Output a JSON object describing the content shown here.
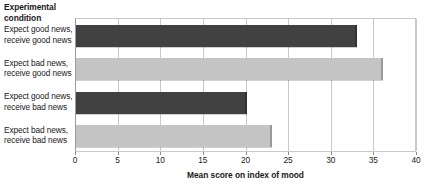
{
  "chart_data": {
    "type": "bar",
    "orientation": "horizontal",
    "title": "",
    "xlabel": "Mean score on index of mood",
    "ylabel": "Experimental\ncondition",
    "categories": [
      "Expect good news, receive good news",
      "Expect bad news, receive good news",
      "Expect good news, receive bad news",
      "Expect bad news, receive bad news"
    ],
    "values": [
      33,
      36,
      20,
      23
    ],
    "xlim": [
      0,
      40
    ],
    "xticks": [
      0,
      5,
      10,
      15,
      20,
      25,
      30,
      35,
      40
    ],
    "grid": true,
    "grid_axis": "x",
    "legend": false,
    "bar_colors": [
      "#414141",
      "#c4c4c4",
      "#414141",
      "#c4c4c4"
    ]
  },
  "axes": {
    "category_axis_title_lines": [
      "Experimental",
      "condition"
    ],
    "value_axis_title": "Mean score on index of mood",
    "tick_labels": [
      "0",
      "5",
      "10",
      "15",
      "20",
      "25",
      "30",
      "35",
      "40"
    ]
  },
  "categories": [
    {
      "lines": [
        "Expect good news,",
        "receive good news"
      ],
      "value": 33,
      "color": "#414141"
    },
    {
      "lines": [
        "Expect bad news,",
        "receive good news"
      ],
      "value": 36,
      "color": "#c4c4c4"
    },
    {
      "lines": [
        "Expect good news,",
        "receive bad news"
      ],
      "value": 20,
      "color": "#414141"
    },
    {
      "lines": [
        "Expect bad news,",
        "receive bad news"
      ],
      "value": 23,
      "color": "#c4c4c4"
    }
  ],
  "colors": {
    "dark_bar": "#414141",
    "light_bar": "#c4c4c4",
    "grid": "#c9c9c9",
    "axis": "#9a9a9a",
    "text": "#1a1a1a",
    "background": "#ffffff"
  }
}
